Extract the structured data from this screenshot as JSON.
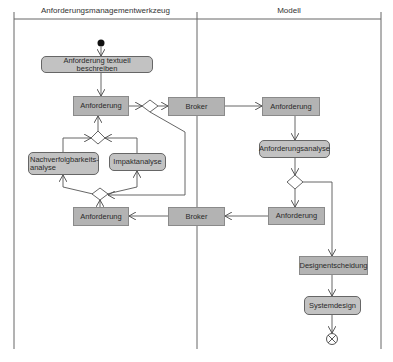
{
  "swimlanes": [
    {
      "title": "Anforderungsmanagementwerkzeug"
    },
    {
      "title": "Modell"
    }
  ],
  "nodes": {
    "textuell": "Anforderung textuell beschreiben",
    "anf_left_top": "Anforderung",
    "broker_top": "Broker",
    "anf_right_top": "Anforderung",
    "anforderungsanalyse": "Anforderungsanalyse",
    "anf_right_bottom": "Anforderung",
    "broker_bottom": "Broker",
    "anf_left_bottom": "Anforderung",
    "nachverfolgbarkeit": "Nachverfolgbarkeits-analyse",
    "impakt": "Impaktanalyse",
    "designentscheidung": "Designentscheidung",
    "systemdesign": "Systemdesign"
  },
  "colors": {
    "object_fill": "#b3b3b3",
    "activity_fill": "#c2c2c2",
    "line": "#555555"
  }
}
